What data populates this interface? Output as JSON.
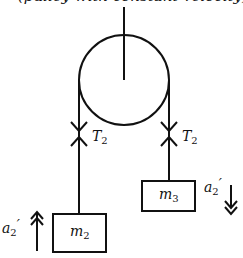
{
  "clipped_caption": "(pulley with constant velocity),",
  "labels": {
    "tension_left": {
      "base": "T",
      "sub": "2"
    },
    "tension_right": {
      "base": "T",
      "sub": "2"
    },
    "mass_left": {
      "base": "m",
      "sub": "2"
    },
    "mass_right": {
      "base": "m",
      "sub": "3"
    },
    "accel_left": {
      "base": "a",
      "sub": "2",
      "prime": "′",
      "direction": "up"
    },
    "accel_right": {
      "base": "a",
      "sub": "2",
      "prime": "′",
      "direction": "down"
    }
  }
}
